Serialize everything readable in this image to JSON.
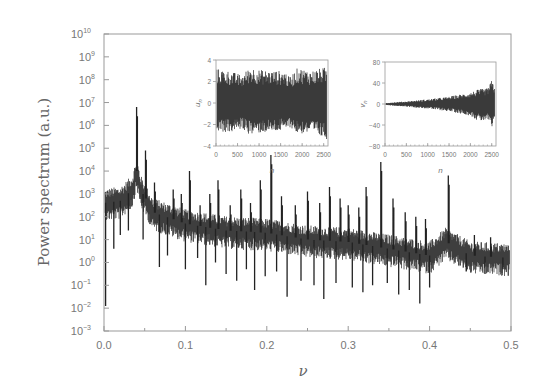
{
  "chart_data": {
    "type": "line",
    "title": "",
    "xlabel": "ν",
    "ylabel": "Power spectrum (a.u.)",
    "xlim": [
      0.0,
      0.5
    ],
    "ylim_log10": [
      -3,
      10
    ],
    "yscale": "log",
    "grid": false,
    "legend": null,
    "x_ticks": [
      "0.0",
      "0.1",
      "0.2",
      "0.3",
      "0.4",
      "0.5"
    ],
    "y_ticks": [
      "10^10",
      "10^9",
      "10^8",
      "10^7",
      "10^6",
      "10^5",
      "10^4",
      "10^3",
      "10^2",
      "10^1",
      "10^0",
      "10^-1",
      "10^-2",
      "10^-3"
    ],
    "series": [
      {
        "name": "power spectrum",
        "color": "#222222",
        "baseline_log10": {
          "x": [
            0.0,
            0.02,
            0.035,
            0.04,
            0.045,
            0.06,
            0.1,
            0.15,
            0.2,
            0.25,
            0.3,
            0.35,
            0.4,
            0.42,
            0.45,
            0.5
          ],
          "y": [
            2.6,
            2.7,
            3.2,
            4.0,
            3.2,
            2.2,
            1.7,
            1.4,
            1.3,
            1.0,
            0.9,
            0.6,
            0.3,
            0.9,
            0.3,
            0.2
          ]
        },
        "peaks": [
          {
            "x": 0.04,
            "log10": 6.8
          },
          {
            "x": 0.051,
            "log10": 4.9
          },
          {
            "x": 0.062,
            "log10": 3.5
          },
          {
            "x": 0.085,
            "log10": 3.2
          },
          {
            "x": 0.095,
            "log10": 3.0
          },
          {
            "x": 0.105,
            "log10": 4.0
          },
          {
            "x": 0.118,
            "log10": 2.5
          },
          {
            "x": 0.13,
            "log10": 3.0
          },
          {
            "x": 0.14,
            "log10": 3.6
          },
          {
            "x": 0.155,
            "log10": 2.5
          },
          {
            "x": 0.168,
            "log10": 3.2
          },
          {
            "x": 0.18,
            "log10": 2.6
          },
          {
            "x": 0.192,
            "log10": 3.6
          },
          {
            "x": 0.205,
            "log10": 4.7
          },
          {
            "x": 0.218,
            "log10": 2.9
          },
          {
            "x": 0.235,
            "log10": 2.5
          },
          {
            "x": 0.25,
            "log10": 3.1
          },
          {
            "x": 0.265,
            "log10": 2.6
          },
          {
            "x": 0.277,
            "log10": 3.3
          },
          {
            "x": 0.29,
            "log10": 2.8
          },
          {
            "x": 0.3,
            "log10": 2.5
          },
          {
            "x": 0.313,
            "log10": 2.4
          },
          {
            "x": 0.322,
            "log10": 3.3
          },
          {
            "x": 0.34,
            "log10": 4.4
          },
          {
            "x": 0.355,
            "log10": 2.8
          },
          {
            "x": 0.37,
            "log10": 2.2
          },
          {
            "x": 0.383,
            "log10": 2.0
          },
          {
            "x": 0.395,
            "log10": 1.9
          },
          {
            "x": 0.423,
            "log10": 3.8
          },
          {
            "x": 0.455,
            "log10": 1.2
          },
          {
            "x": 0.475,
            "log10": 1.1
          }
        ],
        "dips": [
          {
            "x": 0.002,
            "log10": -1.9
          },
          {
            "x": 0.012,
            "log10": 0.6
          },
          {
            "x": 0.02,
            "log10": 1.2
          },
          {
            "x": 0.03,
            "log10": 1.4
          },
          {
            "x": 0.048,
            "log10": 1.0
          },
          {
            "x": 0.068,
            "log10": -0.2
          },
          {
            "x": 0.078,
            "log10": 0.3
          },
          {
            "x": 0.1,
            "log10": -0.3
          },
          {
            "x": 0.115,
            "log10": 0.2
          },
          {
            "x": 0.125,
            "log10": -1.0
          },
          {
            "x": 0.137,
            "log10": 0.0
          },
          {
            "x": 0.15,
            "log10": -0.5
          },
          {
            "x": 0.163,
            "log10": -0.8
          },
          {
            "x": 0.175,
            "log10": -0.3
          },
          {
            "x": 0.185,
            "log10": -1.2
          },
          {
            "x": 0.198,
            "log10": -0.6
          },
          {
            "x": 0.212,
            "log10": -0.4
          },
          {
            "x": 0.225,
            "log10": -1.5
          },
          {
            "x": 0.242,
            "log10": -0.8
          },
          {
            "x": 0.258,
            "log10": -1.0
          },
          {
            "x": 0.27,
            "log10": -1.6
          },
          {
            "x": 0.285,
            "log10": -0.9
          },
          {
            "x": 0.305,
            "log10": -1.1
          },
          {
            "x": 0.318,
            "log10": -1.3
          },
          {
            "x": 0.33,
            "log10": -1.0
          },
          {
            "x": 0.348,
            "log10": -0.9
          },
          {
            "x": 0.362,
            "log10": -1.4
          },
          {
            "x": 0.375,
            "log10": -1.2
          },
          {
            "x": 0.388,
            "log10": -1.8
          },
          {
            "x": 0.4,
            "log10": -1.1
          },
          {
            "x": 0.445,
            "log10": -0.4
          },
          {
            "x": 0.468,
            "log10": -0.5
          },
          {
            "x": 0.49,
            "log10": -0.3
          }
        ],
        "band_halfwidth_log10": 0.45
      }
    ],
    "insets": [
      {
        "id": "inset-u-n",
        "type": "line",
        "ylabel": "u_n",
        "xlabel": "n",
        "xlim": [
          0,
          2600
        ],
        "ylim": [
          -4,
          4
        ],
        "x_ticks": [
          "0",
          "500",
          "1000",
          "1500",
          "2000",
          "2500"
        ],
        "y_ticks": [
          "4",
          "2",
          "0",
          "-2",
          "-4"
        ],
        "envelope": {
          "n": [
            0,
            300,
            600,
            800,
            1000,
            1300,
            1600,
            1700,
            1900,
            2200,
            2500,
            2600
          ],
          "upper": [
            3.2,
            3.0,
            2.6,
            3.4,
            3.1,
            3.0,
            3.0,
            2.4,
            3.3,
            3.0,
            3.3,
            3.3
          ],
          "lower": [
            -2.6,
            -2.8,
            -2.4,
            -3.0,
            -2.8,
            -2.7,
            -2.6,
            -2.2,
            -2.9,
            -2.8,
            -3.3,
            -3.4
          ]
        }
      },
      {
        "id": "inset-v-n",
        "type": "line",
        "ylabel": "v_n",
        "xlabel": "n",
        "xlim": [
          0,
          2600
        ],
        "ylim": [
          -80,
          80
        ],
        "x_ticks": [
          "0",
          "500",
          "1000",
          "1500",
          "2000",
          "2500"
        ],
        "y_ticks": [
          "80",
          "40",
          "0",
          "-40",
          "-80"
        ],
        "envelope": {
          "n": [
            0,
            500,
            1000,
            1500,
            2000,
            2200,
            2400,
            2500,
            2600
          ],
          "upper": [
            2,
            5,
            9,
            14,
            22,
            28,
            30,
            45,
            28
          ],
          "lower": [
            -2,
            -5,
            -9,
            -14,
            -22,
            -34,
            -30,
            -48,
            -30
          ]
        }
      }
    ]
  }
}
